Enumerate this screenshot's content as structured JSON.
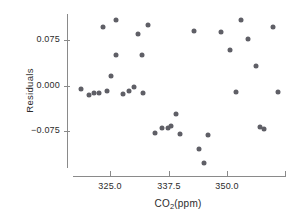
{
  "chart_data": {
    "type": "scatter",
    "title": "",
    "xlabel": "CO2(ppm)",
    "ylabel": "Residuals",
    "xlabel_parts": {
      "pre": "CO",
      "sub": "2",
      "post": "(ppm)"
    },
    "xlim": [
      317.0,
      362.5
    ],
    "ylim": [
      -0.135,
      0.118
    ],
    "grid": false,
    "legend": null,
    "marker_color": "#5f5f66",
    "axis_color": "#8a8a8a",
    "text_color": "#2b2b2b",
    "xticks": [
      {
        "value": 325.0,
        "label": "325.0"
      },
      {
        "value": 337.5,
        "label": "337.5"
      },
      {
        "value": 350.0,
        "label": "350.0"
      },
      {
        "value": 362.5,
        "label": ""
      }
    ],
    "yticks": [
      {
        "value": 0.075,
        "label": "0.075"
      },
      {
        "value": 0.0,
        "label": "0.000"
      },
      {
        "value": -0.075,
        "label": "−0.075"
      }
    ],
    "points": [
      {
        "x": 318.6,
        "y": -0.0045
      },
      {
        "x": 323.4,
        "y": 0.096
      },
      {
        "x": 320.5,
        "y": -0.0155
      },
      {
        "x": 321.4,
        "y": -0.012
      },
      {
        "x": 322.6,
        "y": -0.011
      },
      {
        "x": 326.2,
        "y": 0.108
      },
      {
        "x": 324.3,
        "y": -0.0085
      },
      {
        "x": 325.2,
        "y": 0.016
      },
      {
        "x": 326.3,
        "y": 0.05
      },
      {
        "x": 327.7,
        "y": -0.013
      },
      {
        "x": 329.1,
        "y": -0.009
      },
      {
        "x": 331.0,
        "y": 0.0845
      },
      {
        "x": 330.1,
        "y": -0.0015
      },
      {
        "x": 331.8,
        "y": 0.05
      },
      {
        "x": 333.0,
        "y": 0.1
      },
      {
        "x": 332.0,
        "y": -0.0125
      },
      {
        "x": 334.5,
        "y": -0.0775
      },
      {
        "x": 336.1,
        "y": -0.069
      },
      {
        "x": 337.3,
        "y": -0.07
      },
      {
        "x": 338.0,
        "y": -0.0655
      },
      {
        "x": 339.0,
        "y": -0.0455
      },
      {
        "x": 339.9,
        "y": -0.079
      },
      {
        "x": 342.9,
        "y": 0.0905
      },
      {
        "x": 344.0,
        "y": -0.1035
      },
      {
        "x": 345.0,
        "y": -0.1265
      },
      {
        "x": 345.9,
        "y": -0.081
      },
      {
        "x": 348.8,
        "y": 0.0885
      },
      {
        "x": 350.7,
        "y": 0.0595
      },
      {
        "x": 352.0,
        "y": -0.0105
      },
      {
        "x": 353.1,
        "y": 0.1085
      },
      {
        "x": 354.5,
        "y": 0.0775
      },
      {
        "x": 356.3,
        "y": 0.033
      },
      {
        "x": 357.2,
        "y": -0.068
      },
      {
        "x": 358.0,
        "y": -0.071
      },
      {
        "x": 360.0,
        "y": 0.0975
      },
      {
        "x": 360.9,
        "y": -0.0105
      }
    ]
  }
}
